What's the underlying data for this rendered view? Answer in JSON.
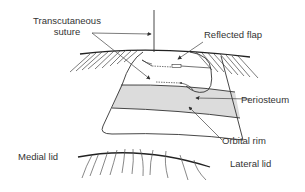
{
  "labels": {
    "transcutaneous_line1": "Transcutaneous",
    "transcutaneous_line2": "suture",
    "reflected_flap": "Reflected flap",
    "periosteum": "Periosteum",
    "orbital_rim": "Orbital rim",
    "medial_lid": "Medial lid",
    "lateral_lid": "Lateral lid"
  },
  "colors": {
    "line": "#333333",
    "periosteum_fill": "#dcdcdc",
    "background": "#ffffff"
  }
}
